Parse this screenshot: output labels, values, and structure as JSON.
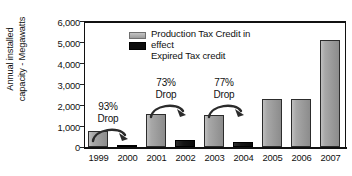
{
  "chart_data": {
    "type": "bar",
    "title": "",
    "subtitle": "",
    "xlabel": "",
    "ylabel": "Annual installed capacity - Megawatts",
    "ylabel_line1": "Annual installed",
    "ylabel_line2": "capacity - Megawatts",
    "categories": [
      "1999",
      "2000",
      "2001",
      "2002",
      "2003",
      "2004",
      "2005",
      "2006",
      "2007"
    ],
    "values": [
      770,
      50,
      1600,
      330,
      1550,
      250,
      2300,
      2280,
      5100
    ],
    "bar_states": [
      "in-effect",
      "expired",
      "in-effect",
      "expired",
      "in-effect",
      "expired",
      "in-effect",
      "in-effect",
      "in-effect"
    ],
    "series": [
      {
        "name": "Production Tax Credit in effect",
        "color": "#9a9a9a",
        "points": [
          {
            "x": "1999",
            "y": 770
          },
          {
            "x": "2001",
            "y": 1600
          },
          {
            "x": "2003",
            "y": 1550
          },
          {
            "x": "2005",
            "y": 2300
          },
          {
            "x": "2006",
            "y": 2280
          },
          {
            "x": "2007",
            "y": 5100
          }
        ]
      },
      {
        "name": "Expired Tax credit",
        "color": "#0c0c0c",
        "points": [
          {
            "x": "2000",
            "y": 50
          },
          {
            "x": "2002",
            "y": 330
          },
          {
            "x": "2004",
            "y": 250
          }
        ]
      }
    ],
    "ylim": [
      0,
      6000
    ],
    "ytick_values": [
      0,
      1000,
      2000,
      3000,
      4000,
      5000,
      6000
    ],
    "ytick_labels": [
      "0",
      "1,000",
      "2,000",
      "3,000",
      "4,000",
      "5,000",
      "6,000"
    ],
    "grid": false,
    "legend_position": "inside-top-left",
    "annotations": [
      {
        "percent": "93%",
        "word": "Drop",
        "from": "1999",
        "to": "2000"
      },
      {
        "percent": "73%",
        "word": "Drop",
        "from": "2001",
        "to": "2002"
      },
      {
        "percent": "77%",
        "word": "Drop",
        "from": "2003",
        "to": "2004"
      }
    ]
  },
  "legend": {
    "items": [
      {
        "label_line1": "Production Tax Credit in",
        "label_line2": "effect",
        "swatch": "gray-swatch-icon"
      },
      {
        "label_line1": "Expired Tax credit",
        "label_line2": "",
        "swatch": "black-swatch-icon"
      }
    ]
  },
  "colors": {
    "bar_in_effect": "#9a9a9a",
    "bar_expired": "#0c0c0c",
    "axis": "#111111",
    "background": "#ffffff"
  }
}
